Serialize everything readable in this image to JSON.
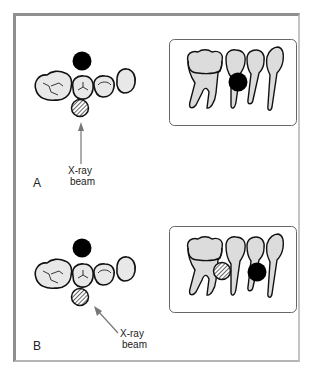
{
  "figure": {
    "panels": [
      {
        "id": "A",
        "label": "A",
        "beam_label_line1": "X-ray",
        "beam_label_line2": "beam",
        "beam_direction": "perpendicular",
        "radiograph_result": "objects superimposed"
      },
      {
        "id": "B",
        "label": "B",
        "beam_label_line1": "X-ray",
        "beam_label_line2": "beam",
        "beam_direction": "angled from distal",
        "radiograph_result": "objects separated"
      }
    ],
    "legend": {
      "solid_circle": "buccal object",
      "hatched_circle": "lingual object"
    },
    "colors": {
      "frame": "#8f8f8f",
      "tooth_fill": "#e6e6e6",
      "outline": "#111111",
      "object": "#000000",
      "arrow": "#777777"
    }
  }
}
